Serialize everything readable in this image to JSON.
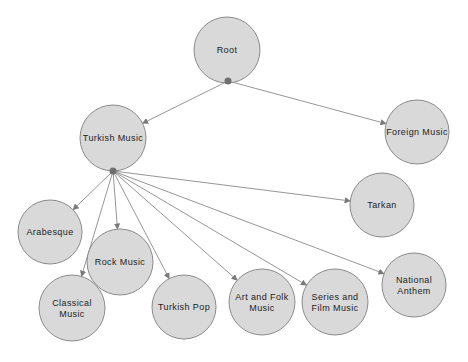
{
  "diagram": {
    "type": "tree",
    "colors": {
      "node_fill": "#d9d9d9",
      "node_stroke": "#8a8a8a",
      "edge": "#8a8a8a",
      "junction": "#707070",
      "text": "#222222"
    },
    "nodes": [
      {
        "id": "root",
        "lines": [
          "Root"
        ],
        "cx": 227,
        "cy": 50,
        "r": 33
      },
      {
        "id": "turkish",
        "lines": [
          "Turkish Music"
        ],
        "cx": 113,
        "cy": 138,
        "r": 33
      },
      {
        "id": "foreign",
        "lines": [
          "Foreign Music"
        ],
        "cx": 417,
        "cy": 132,
        "r": 32
      },
      {
        "id": "tarkan",
        "lines": [
          "Tarkan"
        ],
        "cx": 382,
        "cy": 205,
        "r": 32
      },
      {
        "id": "arabesque",
        "lines": [
          "Arabesque"
        ],
        "cx": 50,
        "cy": 232,
        "r": 32
      },
      {
        "id": "rock",
        "lines": [
          "Rock Music"
        ],
        "cx": 120,
        "cy": 262,
        "r": 33
      },
      {
        "id": "classical",
        "lines": [
          "Classical",
          "Music"
        ],
        "cx": 72,
        "cy": 308,
        "r": 33
      },
      {
        "id": "turkishpop",
        "lines": [
          "Turkish Pop"
        ],
        "cx": 184,
        "cy": 307,
        "r": 32
      },
      {
        "id": "artfolk",
        "lines": [
          "Art and Folk",
          "Music"
        ],
        "cx": 262,
        "cy": 302,
        "r": 33
      },
      {
        "id": "series",
        "lines": [
          "Series and",
          "Film Music"
        ],
        "cx": 335,
        "cy": 302,
        "r": 33
      },
      {
        "id": "anthem",
        "lines": [
          "National",
          "Anthem"
        ],
        "cx": 414,
        "cy": 285,
        "r": 32
      }
    ],
    "junctions": [
      {
        "id": "j-root",
        "x": 228,
        "y": 81,
        "children": [
          "turkish",
          "foreign"
        ]
      },
      {
        "id": "j-turkish",
        "x": 113,
        "y": 171,
        "children": [
          "arabesque",
          "classical",
          "rock",
          "turkishpop",
          "artfolk",
          "series",
          "anthem",
          "tarkan"
        ]
      }
    ]
  }
}
